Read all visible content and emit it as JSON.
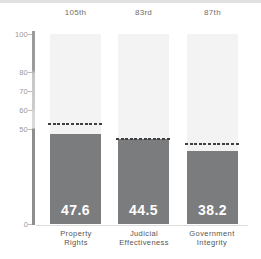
{
  "chart_data": {
    "type": "bar",
    "categories": [
      "Property Rights",
      "Judicial Effectiveness",
      "Government Integrity"
    ],
    "category_labels": [
      "Property\nRights",
      "Judicial\nEffectiveness",
      "Government\nIntegrity"
    ],
    "ranks": [
      "105th",
      "83rd",
      "87th"
    ],
    "values": [
      47.6,
      44.5,
      38.2
    ],
    "dashed_line_values": [
      52.5,
      44.5,
      42
    ],
    "dashed_line_note": "unlabeled dashed benchmark lines; values estimated from pixel positions",
    "ylim": [
      0,
      100
    ],
    "yticks": [
      100,
      80,
      70,
      60,
      50,
      0
    ],
    "grid": false,
    "legend": "none",
    "colors": {
      "bar": "#7b7c7e",
      "column_background": "#f3f3f3",
      "dashed_line": "#3f3f3f",
      "value_label": "#ffffff",
      "rank_label": "#6e6e6e",
      "axis_label": "#999999",
      "category_label": "#555555",
      "top_strip": "#e1e1e1"
    }
  }
}
